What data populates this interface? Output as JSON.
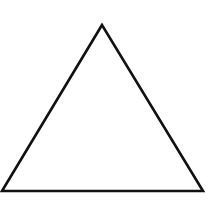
{
  "diagram": {
    "shape": "triangle",
    "type": "equilateral-outline",
    "vertices": {
      "apex": [
        102,
        25
      ],
      "bottom_left": [
        2,
        191
      ],
      "bottom_right": [
        203,
        191
      ]
    },
    "stroke_color": "#111111",
    "stroke_width": 2.6,
    "fill_color": "#ffffff",
    "background": "#ffffff"
  }
}
